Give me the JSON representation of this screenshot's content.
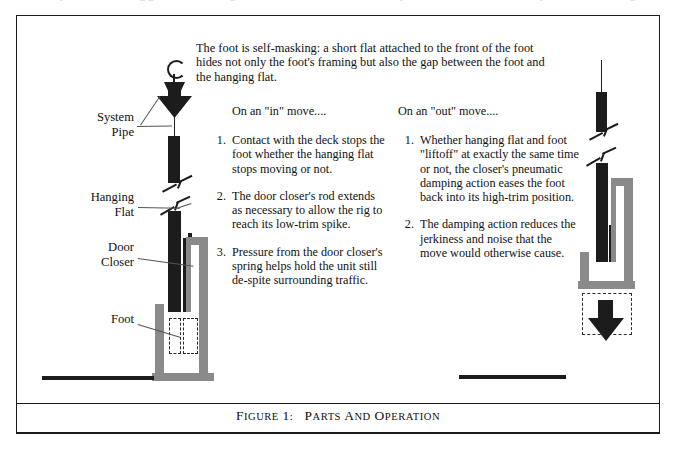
{
  "figure": {
    "caption_prefix": "Figure",
    "caption_number": "1:",
    "caption_title": "Parts and Operation"
  },
  "intro": {
    "text": "The foot is self-masking:  a short flat attached to the front of the foot hides not only the foot's framing but also the gap between the foot and the hanging flat."
  },
  "columns": {
    "left": {
      "heading": "On an \"in\" move....",
      "steps": [
        {
          "num": "1.",
          "text": "Contact with the deck stops the foot whether the hanging flat stops moving or not."
        },
        {
          "num": "2.",
          "text": "The door closer's rod extends as necessary to allow the rig to reach its low-trim spike."
        },
        {
          "num": "3.",
          "text": "Pressure from the door closer's spring helps hold the unit still de-spite surrounding traffic."
        }
      ]
    },
    "right": {
      "heading": "On an \"out\" move....",
      "steps": [
        {
          "num": "1.",
          "text": "Whether hanging flat and  foot \"liftoff\" at exactly the same time or not, the closer's pneumatic damping action eases the foot back into its high-trim position."
        },
        {
          "num": "2.",
          "text": "The damping action reduces the jerkiness and noise that the move would otherwise cause."
        }
      ]
    }
  },
  "part_labels": [
    {
      "id": "system-pipe",
      "line1": "System",
      "line2": "Pipe"
    },
    {
      "id": "hanging-flat",
      "line1": "Hanging",
      "line2": "Flat"
    },
    {
      "id": "door-closer",
      "line1": "Door",
      "line2": "Closer"
    },
    {
      "id": "foot",
      "line1": "Foot",
      "line2": ""
    }
  ],
  "colors": {
    "ink": "#1c1c1c",
    "metal_gray": "#8a8a8a",
    "paper": "#ffffff",
    "leader": "#555555"
  },
  "ghost_top_row": "............."
}
